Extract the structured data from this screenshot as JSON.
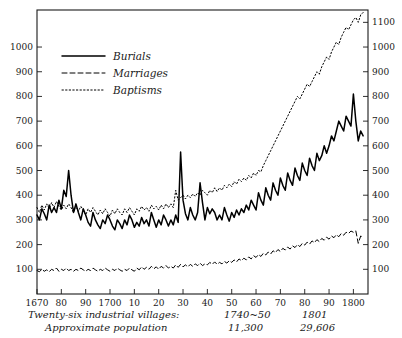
{
  "chart_data": {
    "type": "line",
    "title": "",
    "subtitle": "",
    "xlabel": "",
    "ylabel": "",
    "xlim": [
      1670,
      1806
    ],
    "ylim": [
      0,
      1150
    ],
    "grid": false,
    "legend_position": "top-left",
    "y_ticks_left": [
      100,
      200,
      300,
      400,
      500,
      600,
      700,
      800,
      900,
      1000
    ],
    "y_ticks_right": [
      100,
      200,
      300,
      400,
      500,
      600,
      700,
      800,
      900,
      1000,
      1100
    ],
    "x_ticks": [
      1670,
      1680,
      1690,
      1700,
      1710,
      1720,
      1730,
      1740,
      1750,
      1760,
      1770,
      1780,
      1790,
      1800
    ],
    "x_tick_labels": [
      "1670",
      "80",
      "90",
      "1700",
      "10",
      "20",
      "30",
      "40",
      "50",
      "60",
      "70",
      "80",
      "90",
      "1800"
    ],
    "legend": [
      "Burials",
      "Marriages",
      "Baptisms"
    ],
    "annotations": {
      "caption_line1": "Twenty-six industrial villages:",
      "caption_line2": "Approximate population",
      "col1_header": "1740~50",
      "col1_value": "11,300",
      "col2_header": "1801",
      "col2_value": "29,606"
    },
    "series": [
      {
        "name": "Burials",
        "style": "solid",
        "x": [
          1670,
          1671,
          1672,
          1673,
          1674,
          1675,
          1676,
          1677,
          1678,
          1679,
          1680,
          1681,
          1682,
          1683,
          1684,
          1685,
          1686,
          1687,
          1688,
          1689,
          1690,
          1691,
          1692,
          1693,
          1694,
          1695,
          1696,
          1697,
          1698,
          1699,
          1700,
          1701,
          1702,
          1703,
          1704,
          1705,
          1706,
          1707,
          1708,
          1709,
          1710,
          1711,
          1712,
          1713,
          1714,
          1715,
          1716,
          1717,
          1718,
          1719,
          1720,
          1721,
          1722,
          1723,
          1724,
          1725,
          1726,
          1727,
          1728,
          1729,
          1730,
          1731,
          1732,
          1733,
          1734,
          1735,
          1736,
          1737,
          1738,
          1739,
          1740,
          1741,
          1742,
          1743,
          1744,
          1745,
          1746,
          1747,
          1748,
          1749,
          1750,
          1751,
          1752,
          1753,
          1754,
          1755,
          1756,
          1757,
          1758,
          1759,
          1760,
          1761,
          1762,
          1763,
          1764,
          1765,
          1766,
          1767,
          1768,
          1769,
          1770,
          1771,
          1772,
          1773,
          1774,
          1775,
          1776,
          1777,
          1778,
          1779,
          1780,
          1781,
          1782,
          1783,
          1784,
          1785,
          1786,
          1787,
          1788,
          1789,
          1790,
          1791,
          1792,
          1793,
          1794,
          1795,
          1796,
          1797,
          1798,
          1799,
          1800,
          1801,
          1802,
          1803,
          1804
        ],
        "values": [
          320,
          300,
          345,
          325,
          300,
          360,
          330,
          350,
          330,
          380,
          345,
          420,
          395,
          500,
          400,
          330,
          365,
          330,
          300,
          345,
          320,
          290,
          275,
          330,
          300,
          280,
          265,
          300,
          285,
          320,
          300,
          275,
          260,
          300,
          285,
          265,
          300,
          280,
          320,
          300,
          270,
          290,
          275,
          310,
          285,
          300,
          275,
          330,
          300,
          270,
          300,
          280,
          320,
          300,
          275,
          300,
          280,
          320,
          290,
          575,
          380,
          325,
          300,
          350,
          320,
          300,
          330,
          450,
          370,
          300,
          350,
          325,
          345,
          330,
          300,
          320,
          300,
          350,
          320,
          295,
          330,
          310,
          340,
          320,
          345,
          330,
          360,
          340,
          380,
          360,
          340,
          410,
          380,
          360,
          430,
          400,
          380,
          450,
          420,
          400,
          470,
          440,
          420,
          490,
          460,
          440,
          510,
          480,
          460,
          530,
          500,
          480,
          550,
          520,
          500,
          570,
          540,
          560,
          600,
          570,
          600,
          640,
          620,
          660,
          700,
          680,
          660,
          720,
          700,
          680,
          810,
          700,
          620,
          660,
          640
        ]
      },
      {
        "name": "Marriages",
        "style": "dashed",
        "x": [
          1670,
          1671,
          1672,
          1673,
          1674,
          1675,
          1676,
          1677,
          1678,
          1679,
          1680,
          1681,
          1682,
          1683,
          1684,
          1685,
          1686,
          1687,
          1688,
          1689,
          1690,
          1691,
          1692,
          1693,
          1694,
          1695,
          1696,
          1697,
          1698,
          1699,
          1700,
          1701,
          1702,
          1703,
          1704,
          1705,
          1706,
          1707,
          1708,
          1709,
          1710,
          1711,
          1712,
          1713,
          1714,
          1715,
          1716,
          1717,
          1718,
          1719,
          1720,
          1721,
          1722,
          1723,
          1724,
          1725,
          1726,
          1727,
          1728,
          1729,
          1730,
          1731,
          1732,
          1733,
          1734,
          1735,
          1736,
          1737,
          1738,
          1739,
          1740,
          1741,
          1742,
          1743,
          1744,
          1745,
          1746,
          1747,
          1748,
          1749,
          1750,
          1751,
          1752,
          1753,
          1754,
          1755,
          1756,
          1757,
          1758,
          1759,
          1760,
          1761,
          1762,
          1763,
          1764,
          1765,
          1766,
          1767,
          1768,
          1769,
          1770,
          1771,
          1772,
          1773,
          1774,
          1775,
          1776,
          1777,
          1778,
          1779,
          1780,
          1781,
          1782,
          1783,
          1784,
          1785,
          1786,
          1787,
          1788,
          1789,
          1790,
          1791,
          1792,
          1793,
          1794,
          1795,
          1796,
          1797,
          1798,
          1799,
          1800,
          1801,
          1802,
          1803,
          1804
        ],
        "values": [
          95,
          90,
          100,
          92,
          98,
          90,
          100,
          95,
          105,
          92,
          100,
          95,
          105,
          95,
          100,
          92,
          100,
          95,
          105,
          98,
          92,
          100,
          95,
          105,
          98,
          92,
          100,
          95,
          105,
          98,
          92,
          100,
          95,
          105,
          98,
          92,
          100,
          95,
          105,
          98,
          92,
          105,
          98,
          110,
          100,
          108,
          100,
          112,
          102,
          110,
          100,
          112,
          105,
          115,
          105,
          112,
          105,
          118,
          108,
          120,
          110,
          118,
          110,
          120,
          112,
          122,
          115,
          125,
          115,
          122,
          118,
          128,
          120,
          130,
          120,
          128,
          122,
          132,
          125,
          135,
          128,
          138,
          130,
          142,
          135,
          145,
          138,
          150,
          142,
          155,
          148,
          160,
          152,
          165,
          158,
          170,
          162,
          175,
          168,
          180,
          172,
          185,
          178,
          190,
          182,
          195,
          188,
          200,
          192,
          205,
          198,
          210,
          202,
          215,
          208,
          220,
          212,
          225,
          218,
          230,
          222,
          235,
          228,
          240,
          232,
          245,
          238,
          250,
          245,
          255,
          250,
          255,
          205,
          235,
          230
        ]
      },
      {
        "name": "Baptisms",
        "style": "dotted",
        "x": [
          1670,
          1671,
          1672,
          1673,
          1674,
          1675,
          1676,
          1677,
          1678,
          1679,
          1680,
          1681,
          1682,
          1683,
          1684,
          1685,
          1686,
          1687,
          1688,
          1689,
          1690,
          1691,
          1692,
          1693,
          1694,
          1695,
          1696,
          1697,
          1698,
          1699,
          1700,
          1701,
          1702,
          1703,
          1704,
          1705,
          1706,
          1707,
          1708,
          1709,
          1710,
          1711,
          1712,
          1713,
          1714,
          1715,
          1716,
          1717,
          1718,
          1719,
          1720,
          1721,
          1722,
          1723,
          1724,
          1725,
          1726,
          1727,
          1728,
          1729,
          1730,
          1731,
          1732,
          1733,
          1734,
          1735,
          1736,
          1737,
          1738,
          1739,
          1740,
          1741,
          1742,
          1743,
          1744,
          1745,
          1746,
          1747,
          1748,
          1749,
          1750,
          1751,
          1752,
          1753,
          1754,
          1755,
          1756,
          1757,
          1758,
          1759,
          1760,
          1761,
          1762,
          1763,
          1764,
          1765,
          1766,
          1767,
          1768,
          1769,
          1770,
          1771,
          1772,
          1773,
          1774,
          1775,
          1776,
          1777,
          1778,
          1779,
          1780,
          1781,
          1782,
          1783,
          1784,
          1785,
          1786,
          1787,
          1788,
          1789,
          1790,
          1791,
          1792,
          1793,
          1794,
          1795,
          1796,
          1797,
          1798,
          1799,
          1800,
          1801,
          1802,
          1803,
          1804
        ],
        "values": [
          350,
          330,
          360,
          340,
          365,
          345,
          370,
          350,
          375,
          355,
          340,
          360,
          345,
          365,
          350,
          330,
          350,
          335,
          355,
          340,
          320,
          345,
          330,
          350,
          335,
          320,
          340,
          325,
          345,
          330,
          315,
          340,
          325,
          345,
          330,
          320,
          345,
          330,
          350,
          335,
          320,
          345,
          335,
          355,
          340,
          350,
          335,
          360,
          345,
          355,
          340,
          360,
          345,
          365,
          350,
          365,
          350,
          420,
          380,
          390,
          400,
          385,
          400,
          390,
          405,
          395,
          410,
          400,
          420,
          410,
          400,
          420,
          410,
          430,
          415,
          430,
          420,
          440,
          430,
          445,
          435,
          455,
          445,
          465,
          455,
          470,
          460,
          480,
          470,
          490,
          480,
          500,
          495,
          520,
          540,
          560,
          580,
          600,
          620,
          640,
          660,
          680,
          700,
          720,
          740,
          760,
          780,
          800,
          790,
          810,
          830,
          850,
          840,
          860,
          880,
          900,
          890,
          920,
          940,
          960,
          950,
          980,
          1000,
          1020,
          1010,
          1040,
          1060,
          1080,
          1070,
          1090,
          1110,
          1120,
          1100,
          1130,
          1140
        ]
      }
    ]
  }
}
